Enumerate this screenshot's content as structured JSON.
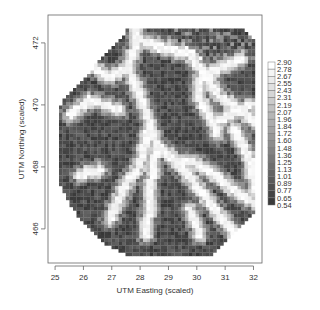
{
  "chart_data": {
    "type": "heatmap",
    "title": "",
    "xlabel": "UTM Easting (scaled)",
    "ylabel": "UTM Northing (scaled)",
    "xlim": [
      24.75,
      32.3
    ],
    "ylim": [
      464.9,
      472.9
    ],
    "x_ticks": [
      25,
      26,
      27,
      28,
      29,
      30,
      31,
      32
    ],
    "x_tick_labels": [
      "25",
      "26",
      "27",
      "28",
      "29",
      "30",
      "31",
      "32"
    ],
    "y_ticks": [
      466,
      468,
      470,
      472
    ],
    "y_tick_labels": [
      "466",
      "468",
      "470",
      "472"
    ],
    "grid": false,
    "colorscale": "grayscale (dark = low, light = high)",
    "color_low": "#3a3a3a",
    "color_high": "#ffffff",
    "colorbar": {
      "placement": "right",
      "breaks": [
        0.54,
        0.65,
        0.77,
        0.89,
        1.01,
        1.13,
        1.25,
        1.36,
        1.48,
        1.6,
        1.72,
        1.84,
        1.96,
        2.07,
        2.19,
        2.31,
        2.43,
        2.55,
        2.67,
        2.78,
        2.9
      ],
      "labels": [
        "2.90",
        "2.78",
        "2.67",
        "2.55",
        "2.43",
        "2.31",
        "2.19",
        "2.07",
        "1.96",
        "1.84",
        "1.72",
        "1.60",
        "1.48",
        "1.36",
        "1.25",
        "1.13",
        "1.01",
        "0.89",
        "0.77",
        "0.65",
        "0.54"
      ]
    },
    "value_range": [
      0.54,
      2.9
    ]
  }
}
